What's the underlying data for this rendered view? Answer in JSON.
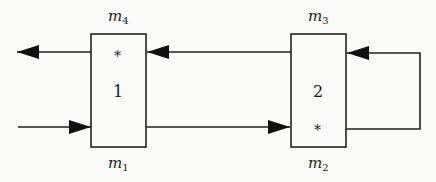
{
  "diagram": {
    "type": "block-flow",
    "colors": {
      "line": "#222222",
      "background": "#fbfbfa"
    },
    "blocks": [
      {
        "id": "block-1",
        "label": "1",
        "top_label": {
          "base": "m",
          "sub": "4"
        },
        "bottom_label": {
          "base": "m",
          "sub": "1"
        },
        "marker": "*",
        "marker_position": "top"
      },
      {
        "id": "block-2",
        "label": "2",
        "top_label": {
          "base": "m",
          "sub": "3"
        },
        "bottom_label": {
          "base": "m",
          "sub": "2"
        },
        "marker": "*",
        "marker_position": "bottom"
      }
    ],
    "edges": [
      {
        "from": "external-left",
        "to": "block-1",
        "level": "bottom",
        "direction": "right"
      },
      {
        "from": "block-1",
        "to": "external-left",
        "level": "top",
        "direction": "left"
      },
      {
        "from": "block-1",
        "to": "block-2",
        "level": "bottom",
        "direction": "right"
      },
      {
        "from": "block-2",
        "to": "block-1",
        "level": "top",
        "direction": "left"
      },
      {
        "from": "block-2",
        "to": "block-2",
        "level": "loop-right",
        "direction": "bottom-to-top"
      }
    ]
  }
}
